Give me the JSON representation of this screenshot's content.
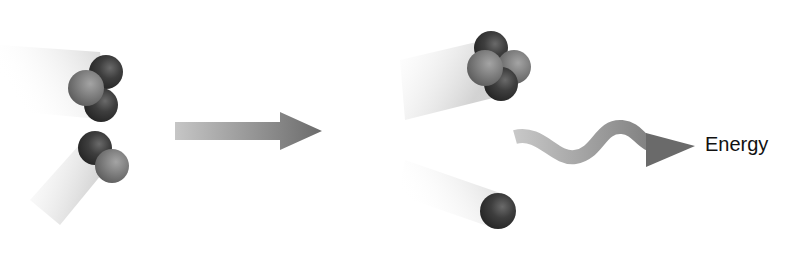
{
  "diagram": {
    "type": "nuclear-fusion",
    "reactants": [
      {
        "id": "reactant-1",
        "description": "nucleus with 2 dark and 1 light particle",
        "particles": [
          "dark",
          "light",
          "dark"
        ]
      },
      {
        "id": "reactant-2",
        "description": "nucleus with 1 dark and 1 light particle",
        "particles": [
          "dark",
          "light"
        ]
      }
    ],
    "products": [
      {
        "id": "product-1",
        "description": "nucleus with 2 dark and 2 light particles",
        "particles": [
          "dark",
          "light",
          "light",
          "dark"
        ]
      },
      {
        "id": "product-2",
        "description": "single dark particle",
        "particles": [
          "dark"
        ]
      }
    ],
    "reaction_arrow": "right-arrow",
    "energy_arrow": "wavy-arrow",
    "energy_label": "Energy"
  },
  "colors": {
    "dark_particle": "#3c3c3c",
    "light_particle": "#7d7d7d",
    "arrow_start": "#c4c4c4",
    "arrow_end": "#6e6e6e",
    "trail": "#d6d6d6"
  }
}
